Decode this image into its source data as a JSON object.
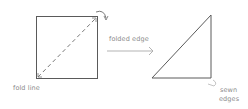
{
  "labels": {
    "fold_line": "fold line",
    "folded_edge": "folded edge",
    "sewn_edges_line1": "sewn",
    "sewn_edges_line2": "edges"
  },
  "colors": {
    "stroke": "#555555",
    "dashed": "#7a7a7a",
    "text": "#8a8a8a",
    "arrow": "#aaaaaa"
  }
}
